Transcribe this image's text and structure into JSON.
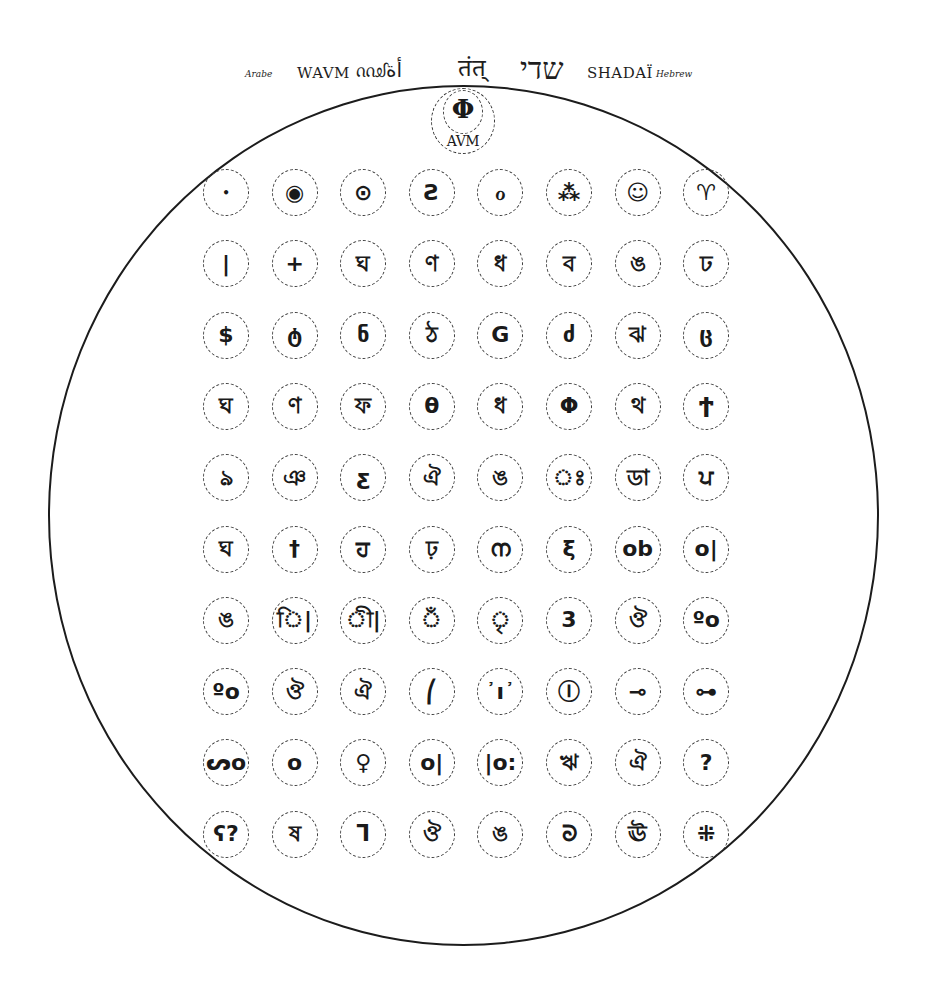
{
  "header": {
    "arabic_label": "Arabe",
    "arabic_latin": "WAVM",
    "arabic_script": "ᦶᦾأة",
    "sanskrit_script": "तंत्",
    "hebrew_script": "שדי",
    "hebrew_latin": "SHADAÏ",
    "hebrew_label": "Hebrew"
  },
  "apex": {
    "symbol": "Φ",
    "label": "AVM"
  },
  "grid": {
    "columns": 8,
    "rows": 10,
    "cells": [
      [
        "•",
        "◉",
        "⊙",
        "Ƨ",
        "ℴ",
        "⁂",
        "☺",
        "♈"
      ],
      [
        "|",
        "+",
        "ঘ",
        "ণ",
        "ধ",
        "ব",
        "ঙ",
        "ঢ"
      ],
      [
        "$",
        "ტ",
        "ნ",
        "ঠ",
        "G",
        "ძ",
        "ঝ",
        "ც"
      ],
      [
        "ঘ",
        "ণ",
        "ফ",
        "θ",
        "ধ",
        "Φ",
        "থ",
        "Ϯ"
      ],
      [
        "ঌ",
        "ঞ",
        "ƹ",
        "ঐ",
        "ঙ",
        "ঃ",
        "ডা",
        "ਪ"
      ],
      [
        "ঘ",
        "†",
        "ਹ",
        "ঢ়",
        "ന",
        "ξ",
        "ob",
        "o|"
      ],
      [
        "ঙ",
        "ি|",
        "ী|",
        "ঁ",
        "ৃ",
        "3",
        "ঔ",
        "ºo"
      ],
      [
        "ºo",
        "ঔ",
        "ঐ",
        "⎛",
        "᾿ı᾿",
        "Ⓘ",
        "⊸",
        "⊶"
      ],
      [
        "ᔕo",
        "ᴏ",
        "♀",
        "o|",
        "|o:",
        "ঋ",
        "ঐ",
        "?"
      ],
      [
        "ʕ?",
        "ষ",
        "ᒣ",
        "ঔ",
        "ঙ",
        "ᘐ",
        "ঊ",
        "⁜"
      ]
    ]
  }
}
